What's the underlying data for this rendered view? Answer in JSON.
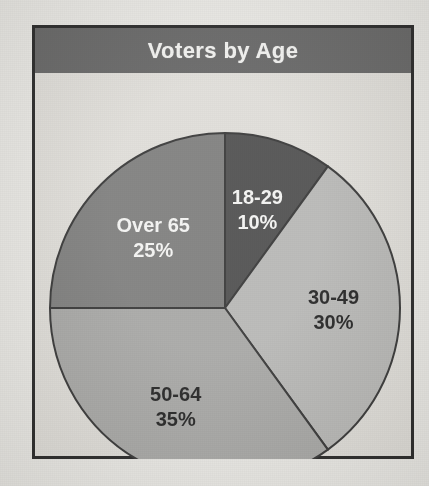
{
  "figure": {
    "title": "Voters by Age",
    "frame_color": "#1c1c1c",
    "banner_color": "#5d5d5d",
    "banner_text_color": "#f2f2f0",
    "plot_background": "#dedcd7"
  },
  "chart_data": {
    "type": "pie",
    "title": "Voters by Age",
    "xlabel": "",
    "ylabel": "",
    "categories": [
      "18-29",
      "30-49",
      "50-64",
      "Over 65"
    ],
    "values": [
      10,
      30,
      35,
      25
    ],
    "value_unit": "%",
    "start_angle_deg": 0,
    "direction": "clockwise",
    "legend": "none",
    "grid": false,
    "slices": [
      {
        "label": "18-29",
        "value": 10,
        "value_text": "10%",
        "color": "#454545",
        "text_color": "#f4f4f2",
        "start_deg": 0,
        "end_deg": 36
      },
      {
        "label": "30-49",
        "value": 30,
        "value_text": "30%",
        "color": "#b4b4b2",
        "text_color": "#171717",
        "start_deg": 36,
        "end_deg": 144
      },
      {
        "label": "50-64",
        "value": 35,
        "value_text": "35%",
        "color": "#a3a3a1",
        "text_color": "#171717",
        "start_deg": 144,
        "end_deg": 270
      },
      {
        "label": "Over 65",
        "value": 25,
        "value_text": "25%",
        "color": "#777776",
        "text_color": "#f4f4f2",
        "start_deg": 270,
        "end_deg": 360
      }
    ]
  }
}
